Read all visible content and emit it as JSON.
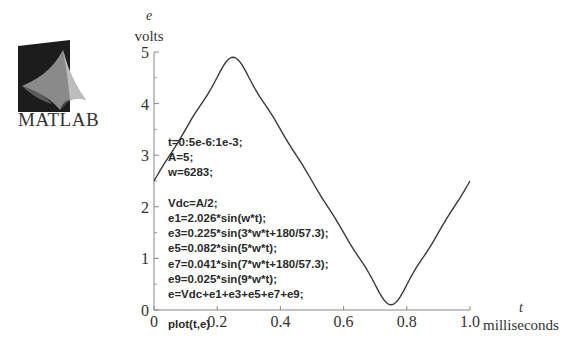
{
  "logo": {
    "text": "MATLAB",
    "icon": "matlab-membrane-icon"
  },
  "code": {
    "lines": [
      "t=0:5e-6:1e-3;",
      "A=5;",
      "w=6283;",
      "",
      "Vdc=A/2;",
      "e1=2.026*sin(w*t);",
      "e3=0.225*sin(3*w*t+180/57.3);",
      "e5=0.082*sin(5*w*t);",
      "e7=0.041*sin(7*w*t+180/57.3);",
      "e9=0.025*sin(9*w*t);",
      "e=Vdc+e1+e3+e5+e7+e9;",
      "",
      "plot(t,e)"
    ]
  },
  "chart_data": {
    "type": "line",
    "title": "",
    "ylabel_symbol": "e",
    "ylabel": "volts",
    "xlabel_symbol": "t",
    "xlabel": "milliseconds",
    "xlim": [
      0,
      1.0
    ],
    "ylim": [
      0,
      5
    ],
    "x_ticks": [
      0,
      0.2,
      0.4,
      0.6,
      0.8,
      1.0
    ],
    "x_tick_labels": [
      "0",
      "0.2",
      "0.4",
      "0.6",
      "0.8",
      "1.0"
    ],
    "y_ticks": [
      0,
      1,
      2,
      3,
      4,
      5
    ],
    "y_tick_labels": [
      "0",
      "1",
      "2",
      "3",
      "4",
      "5"
    ],
    "y_minor_ticks": [
      0.5,
      1.5,
      2.5,
      3.5,
      4.5
    ],
    "grid": false,
    "legend": "none",
    "line_color": "#3a3a3a",
    "series": [
      {
        "name": "e",
        "model": {
          "Vdc": 2.5,
          "w": 6283,
          "t_step_s": 5e-06,
          "t_end_s": 0.001,
          "harmonics": [
            {
              "n": 1,
              "amp": 2.026,
              "phase_rad": 0
            },
            {
              "n": 3,
              "amp": 0.225,
              "phase_rad": 3.1414
            },
            {
              "n": 5,
              "amp": 0.082,
              "phase_rad": 0
            },
            {
              "n": 7,
              "amp": 0.041,
              "phase_rad": 3.1414
            },
            {
              "n": 9,
              "amp": 0.025,
              "phase_rad": 0
            }
          ]
        },
        "key_points": [
          {
            "x": 0,
            "y": 2.5
          },
          {
            "x": 0.25,
            "y": 4.88
          },
          {
            "x": 0.5,
            "y": 2.5
          },
          {
            "x": 0.75,
            "y": 0.12
          },
          {
            "x": 1.0,
            "y": 2.5
          }
        ]
      }
    ]
  }
}
